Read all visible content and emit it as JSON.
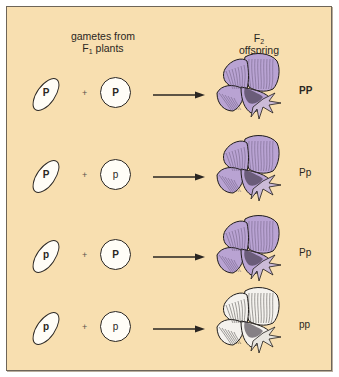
{
  "figure": {
    "background_color": "#f8dfb0",
    "border_color": "#6e6558",
    "purple_color": "#b9a3d3",
    "purple_shade_color": "#5a4a6a",
    "white_flower_color": "#f4f2ee",
    "headings": {
      "left_line1": "gametes from",
      "left_line2_prefix": "F",
      "left_line2_sub": "1",
      "left_line2_suffix": " plants",
      "right_line1_prefix": "F",
      "right_line1_sub": "2",
      "right_line2": "offspring"
    },
    "plus_symbol": "+",
    "rows": [
      {
        "pollen_allele": "P",
        "egg_allele": "P",
        "offspring_genotype": "PP",
        "flower_color": "purple",
        "pollen_bold": true,
        "egg_bold": true
      },
      {
        "pollen_allele": "P",
        "egg_allele": "p",
        "offspring_genotype": "Pp",
        "flower_color": "purple",
        "pollen_bold": true,
        "egg_bold": false
      },
      {
        "pollen_allele": "p",
        "egg_allele": "P",
        "offspring_genotype": "Pp",
        "flower_color": "purple",
        "pollen_bold": false,
        "egg_bold": true
      },
      {
        "pollen_allele": "p",
        "egg_allele": "p",
        "offspring_genotype": "pp",
        "flower_color": "white",
        "pollen_bold": false,
        "egg_bold": false
      }
    ],
    "icons": {
      "pollen": "oval-pollen-gamete-icon",
      "egg": "circle-egg-gamete-icon",
      "arrow": "right-arrow-icon",
      "flower": "pea-flower-icon"
    }
  }
}
